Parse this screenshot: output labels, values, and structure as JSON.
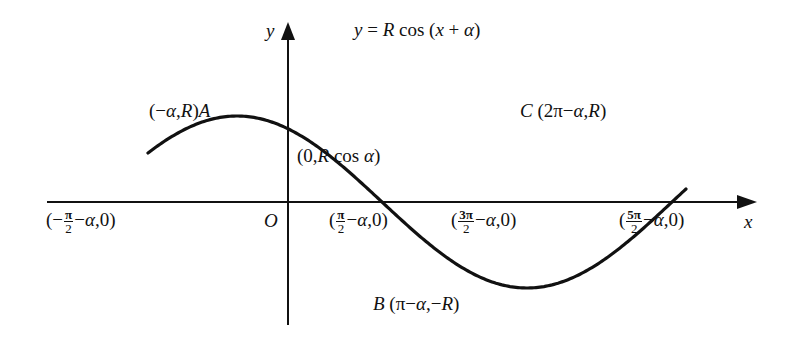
{
  "title": {
    "equation": "y = R cos (x + α)",
    "eq_y": "y",
    "eq_eq": " = ",
    "eq_R": "R",
    "eq_cos": " cos (",
    "eq_x": "x",
    "eq_plus": " + ",
    "eq_alpha": "α",
    "eq_close": ")"
  },
  "axes": {
    "x_label": "x",
    "y_label": "y",
    "origin_label": "O"
  },
  "points": {
    "A": {
      "name": "A",
      "coords": "(−α,R)",
      "open": "(−",
      "a": "α",
      "comma": ",",
      "R": "R",
      "close": ")"
    },
    "C": {
      "name": "C",
      "coords": "(2π−α,R)",
      "open": " (2π−",
      "a": "α",
      "comma": ",",
      "R": "R",
      "close": ")"
    },
    "B": {
      "name": "B",
      "coords": "(π−α,−R)",
      "open": " (π−",
      "a": "α",
      "comma": ",−",
      "R": "R",
      "close": ")"
    },
    "intercept_y": {
      "coords": "(0,R cos α)",
      "open": "(0,",
      "R": "R",
      "cos": " cos ",
      "a": "α",
      "close": ")"
    },
    "zero_left": {
      "coords": "(−π/2−α,0)",
      "pre": "(−",
      "num": "π",
      "den": "2",
      "minus": "−",
      "a": "α",
      "post": ",0)"
    },
    "zero_1": {
      "coords": "(π/2−α,0)",
      "pre": "(",
      "num": "π",
      "den": "2",
      "minus": "−",
      "a": "α",
      "post": ",0)"
    },
    "zero_2": {
      "coords": "(3π/2−α,0)",
      "pre": "(",
      "num": "3π",
      "den": "2",
      "minus": "−",
      "a": "α",
      "post": ",0)"
    },
    "zero_3": {
      "coords": "(5π/2−α,0)",
      "pre": "(",
      "num": "5π",
      "den": "2",
      "minus": "−",
      "a": "α",
      "post": ",0)"
    }
  },
  "style": {
    "line_color": "#111111",
    "background": "#ffffff"
  }
}
